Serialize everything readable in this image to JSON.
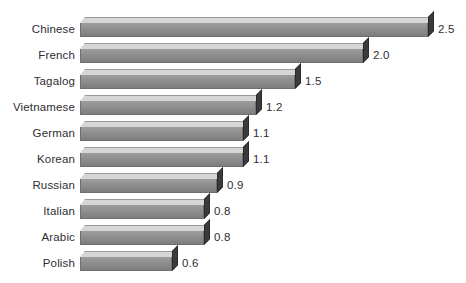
{
  "chart_data": {
    "type": "bar",
    "orientation": "horizontal",
    "title": "",
    "subtitle": "",
    "xlabel": "",
    "ylabel": "",
    "grid": false,
    "legend": null,
    "axis_visible": false,
    "value_label_format": "one-decimal",
    "xlim": [
      0,
      2.5
    ],
    "categories": [
      "Chinese",
      "French",
      "Tagalog",
      "Vietnamese",
      "German",
      "Korean",
      "Russian",
      "Italian",
      "Arabic",
      "Polish"
    ],
    "values": [
      2.5,
      2.0,
      1.5,
      1.2,
      1.1,
      1.1,
      0.9,
      0.8,
      0.8,
      0.6
    ],
    "value_labels": [
      "2.5",
      "2.0",
      "1.5",
      "1.2",
      "1.1",
      "1.1",
      "0.9",
      "0.8",
      "0.8",
      "0.6"
    ],
    "bars": [
      {
        "label": "Chinese",
        "value": 2.5,
        "value_label": "2.5",
        "bar_px": 348
      },
      {
        "label": "French",
        "value": 2.0,
        "value_label": "2.0",
        "bar_px": 283
      },
      {
        "label": "Tagalog",
        "value": 1.5,
        "value_label": "1.5",
        "bar_px": 215
      },
      {
        "label": "Vietnamese",
        "value": 1.2,
        "value_label": "1.2",
        "bar_px": 176
      },
      {
        "label": "German",
        "value": 1.1,
        "value_label": "1.1",
        "bar_px": 163
      },
      {
        "label": "Korean",
        "value": 1.1,
        "value_label": "1.1",
        "bar_px": 163
      },
      {
        "label": "Russian",
        "value": 0.9,
        "value_label": "0.9",
        "bar_px": 137
      },
      {
        "label": "Italian",
        "value": 0.8,
        "value_label": "0.8",
        "bar_px": 124
      },
      {
        "label": "Arabic",
        "value": 0.8,
        "value_label": "0.8",
        "bar_px": 124
      },
      {
        "label": "Polish",
        "value": 0.6,
        "value_label": "0.6",
        "bar_px": 92
      }
    ]
  },
  "colors": {
    "background": "#ffffff",
    "bar_front": "#8b8b8b",
    "bar_top": "#d6d6d6",
    "bar_side": "#3b3b3b",
    "bar_outline": "#6f6f6f",
    "text": "#2e2e33"
  }
}
